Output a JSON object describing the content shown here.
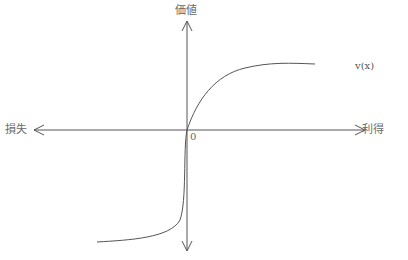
{
  "diagram": {
    "type": "prospect-theory-value-function",
    "axes": {
      "y_label": "価値",
      "x_negative_label": "損失",
      "x_positive_label": "利得",
      "origin_label": "0"
    },
    "curve_label": "v(x)",
    "colors": {
      "axis": "#555555",
      "curve": "#555555",
      "text": "#6a6a6a"
    }
  }
}
